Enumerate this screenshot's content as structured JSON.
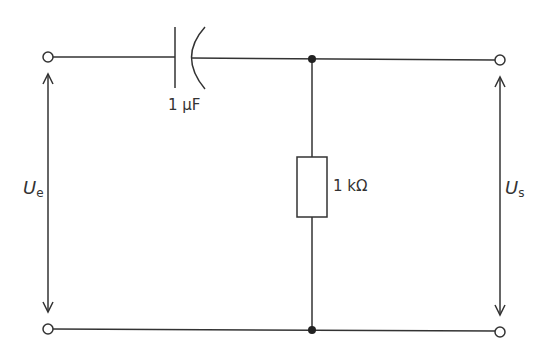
{
  "diagram": {
    "type": "circuit",
    "components": {
      "capacitor": {
        "label": "1 µF"
      },
      "resistor": {
        "label": "1 kΩ"
      }
    },
    "voltages": {
      "input": {
        "symbol": "U",
        "subscript": "e"
      },
      "output": {
        "symbol": "U",
        "subscript": "s"
      }
    },
    "colors": {
      "line": "#333333",
      "background": "#ffffff"
    }
  }
}
